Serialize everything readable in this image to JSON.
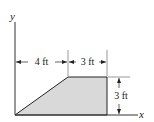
{
  "figure": {
    "axes": {
      "x_label": "x",
      "y_label": "y"
    },
    "dimensions": {
      "bottom_left_width": "4 ft",
      "top_width": "3 ft",
      "height": "3 ft"
    },
    "shape": {
      "type": "trapezoid",
      "fill_color": "#d9d9d9",
      "vertices_ft": [
        [
          0,
          0
        ],
        [
          4,
          3
        ],
        [
          7,
          3
        ],
        [
          7,
          0
        ]
      ]
    }
  }
}
